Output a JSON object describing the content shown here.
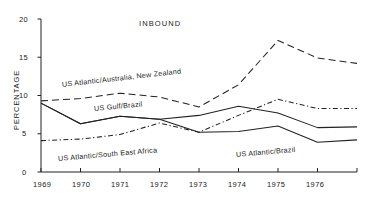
{
  "chart_data": {
    "type": "line",
    "title": "INBOUND",
    "xlabel": "",
    "ylabel": "PERCENTAGE",
    "x": [
      1969,
      1970,
      1971,
      1972,
      1973,
      1974,
      1975,
      1976,
      1977
    ],
    "xtick_labels": [
      "1969",
      "1970",
      "1971",
      "1972",
      "1973",
      "1974",
      "1975",
      "1976",
      ""
    ],
    "ytick_labels": [
      "0",
      "5",
      "10",
      "15",
      "20"
    ],
    "yticks": [
      0,
      5,
      10,
      15,
      20
    ],
    "ylim": [
      0,
      20
    ],
    "xlim": [
      1969,
      1977
    ],
    "grid": false,
    "legend_position": "inline-annotations",
    "series": [
      {
        "name": "US Atlantic/Australia, New Zealand",
        "style": "dashed",
        "color": "#222222",
        "values": [
          9.3,
          9.6,
          10.3,
          9.8,
          8.5,
          11.4,
          17.2,
          14.9,
          14.2
        ]
      },
      {
        "name": "US Gulf/Brazil",
        "style": "solid",
        "color": "#222222",
        "values": [
          9.0,
          6.3,
          7.3,
          6.9,
          7.4,
          8.6,
          7.7,
          5.8,
          5.9
        ]
      },
      {
        "name": "US Atlantic/South East Africa",
        "style": "dash-dot",
        "color": "#222222",
        "values": [
          4.1,
          4.3,
          4.9,
          6.4,
          5.2,
          7.4,
          9.5,
          8.3,
          8.3
        ]
      },
      {
        "name": "US Atlantic/Brazil",
        "style": "solid",
        "color": "#222222",
        "values": [
          9.0,
          6.3,
          7.3,
          6.9,
          5.2,
          5.3,
          6.0,
          3.9,
          4.2
        ]
      }
    ],
    "annotations": [
      {
        "text": "US Atlantic/Australia, New Zealand",
        "x": 1970.0,
        "y": 11.6
      },
      {
        "text": "US Gulf/Brazil",
        "x": 1971.0,
        "y": 8.7
      },
      {
        "text": "US Atlantic/South East Africa",
        "x": 1969.6,
        "y": 3.3
      },
      {
        "text": "US Atlantic/Brazil",
        "x": 1973.9,
        "y": 3.5
      }
    ]
  }
}
